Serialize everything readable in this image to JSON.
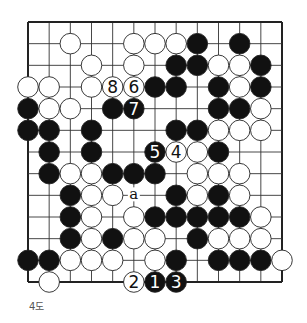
{
  "diagram": {
    "caption": "4도",
    "board": {
      "cols": 13,
      "rows": 13,
      "origin": [
        28,
        22
      ],
      "end": [
        282,
        282
      ],
      "edges": {
        "top": true,
        "left": true,
        "right": true,
        "bottom": true
      }
    },
    "colors": {
      "black": "#111111",
      "white": "#ffffff",
      "line": "#333333",
      "frame": "#222222"
    },
    "stones": [
      {
        "c": 2,
        "r": 1,
        "color": "white"
      },
      {
        "c": 5,
        "r": 1,
        "color": "white"
      },
      {
        "c": 6,
        "r": 1,
        "color": "white"
      },
      {
        "c": 7,
        "r": 1,
        "color": "white"
      },
      {
        "c": 8,
        "r": 1,
        "color": "black"
      },
      {
        "c": 10,
        "r": 1,
        "color": "black"
      },
      {
        "c": 3,
        "r": 2,
        "color": "white"
      },
      {
        "c": 5,
        "r": 2,
        "color": "white"
      },
      {
        "c": 7,
        "r": 2,
        "color": "black"
      },
      {
        "c": 8,
        "r": 2,
        "color": "black"
      },
      {
        "c": 9,
        "r": 2,
        "color": "white"
      },
      {
        "c": 10,
        "r": 2,
        "color": "white"
      },
      {
        "c": 11,
        "r": 2,
        "color": "black"
      },
      {
        "c": 0,
        "r": 3,
        "color": "white"
      },
      {
        "c": 1,
        "r": 3,
        "color": "white"
      },
      {
        "c": 3,
        "r": 3,
        "color": "white"
      },
      {
        "c": 4,
        "r": 3,
        "color": "white",
        "label": "8"
      },
      {
        "c": 5,
        "r": 3,
        "color": "white",
        "label": "6"
      },
      {
        "c": 6,
        "r": 3,
        "color": "black"
      },
      {
        "c": 7,
        "r": 3,
        "color": "black"
      },
      {
        "c": 9,
        "r": 3,
        "color": "black"
      },
      {
        "c": 10,
        "r": 3,
        "color": "white"
      },
      {
        "c": 11,
        "r": 3,
        "color": "black"
      },
      {
        "c": 0,
        "r": 4,
        "color": "black"
      },
      {
        "c": 1,
        "r": 4,
        "color": "white"
      },
      {
        "c": 2,
        "r": 4,
        "color": "white"
      },
      {
        "c": 4,
        "r": 4,
        "color": "black"
      },
      {
        "c": 5,
        "r": 4,
        "color": "black",
        "label": "7"
      },
      {
        "c": 9,
        "r": 4,
        "color": "black"
      },
      {
        "c": 10,
        "r": 4,
        "color": "black"
      },
      {
        "c": 11,
        "r": 4,
        "color": "white"
      },
      {
        "c": 0,
        "r": 5,
        "color": "black"
      },
      {
        "c": 1,
        "r": 5,
        "color": "black"
      },
      {
        "c": 3,
        "r": 5,
        "color": "black"
      },
      {
        "c": 7,
        "r": 5,
        "color": "black"
      },
      {
        "c": 8,
        "r": 5,
        "color": "black"
      },
      {
        "c": 9,
        "r": 5,
        "color": "white"
      },
      {
        "c": 10,
        "r": 5,
        "color": "white"
      },
      {
        "c": 11,
        "r": 5,
        "color": "white"
      },
      {
        "c": 1,
        "r": 6,
        "color": "black"
      },
      {
        "c": 3,
        "r": 6,
        "color": "black"
      },
      {
        "c": 6,
        "r": 6,
        "color": "black",
        "label": "5"
      },
      {
        "c": 7,
        "r": 6,
        "color": "white",
        "label": "4"
      },
      {
        "c": 8,
        "r": 6,
        "color": "white"
      },
      {
        "c": 9,
        "r": 6,
        "color": "black"
      },
      {
        "c": 1,
        "r": 7,
        "color": "black"
      },
      {
        "c": 2,
        "r": 7,
        "color": "white"
      },
      {
        "c": 3,
        "r": 7,
        "color": "white"
      },
      {
        "c": 4,
        "r": 7,
        "color": "black"
      },
      {
        "c": 5,
        "r": 7,
        "color": "black"
      },
      {
        "c": 6,
        "r": 7,
        "color": "black"
      },
      {
        "c": 8,
        "r": 7,
        "color": "white"
      },
      {
        "c": 9,
        "r": 7,
        "color": "white"
      },
      {
        "c": 10,
        "r": 7,
        "color": "white"
      },
      {
        "c": 2,
        "r": 8,
        "color": "black"
      },
      {
        "c": 3,
        "r": 8,
        "color": "white"
      },
      {
        "c": 4,
        "r": 8,
        "color": "white"
      },
      {
        "c": 7,
        "r": 8,
        "color": "black"
      },
      {
        "c": 8,
        "r": 8,
        "color": "white"
      },
      {
        "c": 9,
        "r": 8,
        "color": "black"
      },
      {
        "c": 10,
        "r": 8,
        "color": "white"
      },
      {
        "c": 2,
        "r": 9,
        "color": "black"
      },
      {
        "c": 3,
        "r": 9,
        "color": "white"
      },
      {
        "c": 5,
        "r": 9,
        "color": "white"
      },
      {
        "c": 6,
        "r": 9,
        "color": "black"
      },
      {
        "c": 7,
        "r": 9,
        "color": "black"
      },
      {
        "c": 8,
        "r": 9,
        "color": "black"
      },
      {
        "c": 9,
        "r": 9,
        "color": "black"
      },
      {
        "c": 10,
        "r": 9,
        "color": "black"
      },
      {
        "c": 11,
        "r": 9,
        "color": "white"
      },
      {
        "c": 2,
        "r": 10,
        "color": "black"
      },
      {
        "c": 3,
        "r": 10,
        "color": "white"
      },
      {
        "c": 4,
        "r": 10,
        "color": "black"
      },
      {
        "c": 5,
        "r": 10,
        "color": "white"
      },
      {
        "c": 6,
        "r": 10,
        "color": "white"
      },
      {
        "c": 8,
        "r": 10,
        "color": "black"
      },
      {
        "c": 9,
        "r": 10,
        "color": "white"
      },
      {
        "c": 10,
        "r": 10,
        "color": "white"
      },
      {
        "c": 11,
        "r": 10,
        "color": "white"
      },
      {
        "c": 0,
        "r": 11,
        "color": "black"
      },
      {
        "c": 1,
        "r": 11,
        "color": "black"
      },
      {
        "c": 2,
        "r": 11,
        "color": "white"
      },
      {
        "c": 3,
        "r": 11,
        "color": "white"
      },
      {
        "c": 4,
        "r": 11,
        "color": "white"
      },
      {
        "c": 6,
        "r": 11,
        "color": "white"
      },
      {
        "c": 7,
        "r": 11,
        "color": "black"
      },
      {
        "c": 9,
        "r": 11,
        "color": "black"
      },
      {
        "c": 10,
        "r": 11,
        "color": "black"
      },
      {
        "c": 11,
        "r": 11,
        "color": "black"
      },
      {
        "c": 12,
        "r": 11,
        "color": "white"
      },
      {
        "c": 1,
        "r": 12,
        "color": "white"
      },
      {
        "c": 5,
        "r": 12,
        "color": "white",
        "label": "2"
      },
      {
        "c": 6,
        "r": 12,
        "color": "black",
        "label": "1"
      },
      {
        "c": 7,
        "r": 12,
        "color": "black",
        "label": "3"
      }
    ],
    "markers": [
      {
        "c": 5,
        "r": 8,
        "label": "a"
      }
    ]
  }
}
